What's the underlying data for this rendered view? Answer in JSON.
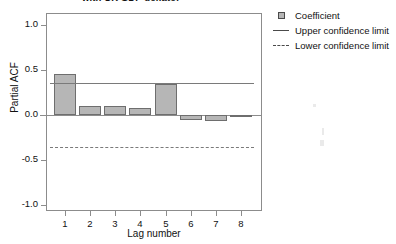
{
  "chart_data": {
    "type": "bar",
    "title": "with UK GDP deflator",
    "xlabel": "Lag number",
    "ylabel": "Partial ACF",
    "categories": [
      "1",
      "2",
      "3",
      "4",
      "5",
      "6",
      "7",
      "8"
    ],
    "values": [
      0.46,
      0.1,
      0.105,
      0.08,
      0.34,
      -0.06,
      -0.07,
      -0.02
    ],
    "series": [
      {
        "name": "Coefficient",
        "values": [
          0.46,
          0.1,
          0.105,
          0.08,
          0.34,
          -0.06,
          -0.07,
          -0.02
        ]
      }
    ],
    "ylim": [
      -1.0,
      1.0
    ],
    "yticks": [
      "1.0",
      "0.5",
      "0.0",
      "-0.5",
      "-1.0"
    ],
    "ytick_values": [
      1.0,
      0.5,
      0.0,
      -0.5,
      -1.0
    ],
    "xticks": [
      "1",
      "2",
      "3",
      "4",
      "5",
      "6",
      "7",
      "8"
    ],
    "grid": false,
    "legend_position": "right",
    "upper_confidence_limit": 0.36,
    "lower_confidence_limit": -0.36,
    "annotations": []
  },
  "legend": {
    "items": [
      {
        "label": "Coefficient",
        "key": "bar-swatch-icon"
      },
      {
        "label": "Upper confidence limit",
        "key": "solid-line-icon"
      },
      {
        "label": "Lower confidence limit",
        "key": "dashed-line-icon"
      }
    ]
  },
  "colors": {
    "bar_fill": "#b6b6b6",
    "bar_border": "#6e6e6e",
    "axis": "#8c8c8c",
    "confidence": "#7a7a7a",
    "text": "#111111",
    "background": "#ffffff"
  }
}
